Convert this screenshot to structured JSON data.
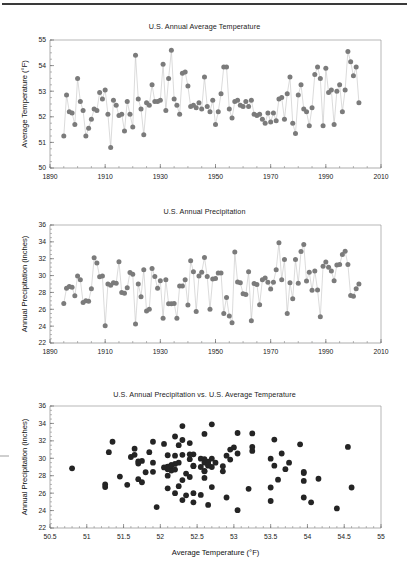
{
  "page": {
    "background": "#ffffff",
    "rule_color": "#3a3a3a",
    "marker_color_line_charts": "#7b7b7b",
    "marker_color_scatter": "#242424",
    "connector_color": "#bdbdbd"
  },
  "chart_data": [
    {
      "id": "temperature-timeseries",
      "type": "line",
      "title": "U.S. Annual Average Temperature",
      "xlabel": "",
      "ylabel": "Average Temperature (°F)",
      "xlim": [
        1890,
        2010
      ],
      "ylim": [
        50,
        55
      ],
      "xticks": [
        1890,
        1910,
        1930,
        1950,
        1970,
        1990,
        2010
      ],
      "yticks": [
        50,
        51,
        52,
        53,
        54,
        55
      ],
      "xtick_labels": [
        "1890",
        "1910",
        "1930",
        "1950",
        "1970",
        "1990",
        "2010"
      ],
      "ytick_labels": [
        "50",
        "51",
        "52",
        "53",
        "54",
        "55"
      ],
      "x_minor_step": 5,
      "y_minor_step": 0.25,
      "grid": false,
      "legend": "none",
      "markers": true,
      "x": [
        1895,
        1896,
        1897,
        1898,
        1899,
        1900,
        1901,
        1902,
        1903,
        1904,
        1905,
        1906,
        1907,
        1908,
        1909,
        1910,
        1911,
        1912,
        1913,
        1914,
        1915,
        1916,
        1917,
        1918,
        1919,
        1920,
        1921,
        1922,
        1923,
        1924,
        1925,
        1926,
        1927,
        1928,
        1929,
        1930,
        1931,
        1932,
        1933,
        1934,
        1935,
        1936,
        1937,
        1938,
        1939,
        1940,
        1941,
        1942,
        1943,
        1944,
        1945,
        1946,
        1947,
        1948,
        1949,
        1950,
        1951,
        1952,
        1953,
        1954,
        1955,
        1956,
        1957,
        1958,
        1959,
        1960,
        1961,
        1962,
        1963,
        1964,
        1965,
        1966,
        1967,
        1968,
        1969,
        1970,
        1971,
        1972,
        1973,
        1974,
        1975,
        1976,
        1977,
        1978,
        1979,
        1980,
        1981,
        1982,
        1983,
        1984,
        1985,
        1986,
        1987,
        1988,
        1989,
        1990,
        1991,
        1992,
        1993,
        1994,
        1995,
        1996,
        1997,
        1998,
        1999,
        2000,
        2001,
        2002
      ],
      "y": [
        51.25,
        52.85,
        52.2,
        52.15,
        51.7,
        53.5,
        52.6,
        52.25,
        51.25,
        51.55,
        51.9,
        52.3,
        52.25,
        52.95,
        52.7,
        53.05,
        52.1,
        50.8,
        52.65,
        52.45,
        52.05,
        52.1,
        51.45,
        52.6,
        52.1,
        51.6,
        54.4,
        52.7,
        52.3,
        51.3,
        52.55,
        52.45,
        53.25,
        52.6,
        52.6,
        52.65,
        54.05,
        52.25,
        53.5,
        54.6,
        52.7,
        52.45,
        52.1,
        53.7,
        53.75,
        53.2,
        52.4,
        52.45,
        52.35,
        52.55,
        52.3,
        53.55,
        52.4,
        52.2,
        52.65,
        51.7,
        52.2,
        52.9,
        53.95,
        53.95,
        52.3,
        51.95,
        52.6,
        52.65,
        52.45,
        52.4,
        52.6,
        52.4,
        52.65,
        52.1,
        52.05,
        52.1,
        51.9,
        51.75,
        52.15,
        51.8,
        52.15,
        51.85,
        52.7,
        52.75,
        51.9,
        52.9,
        53.55,
        51.75,
        51.35,
        52.85,
        53.25,
        52.3,
        52.2,
        51.65,
        52.35,
        53.65,
        53.95,
        53.5,
        51.65,
        53.9,
        52.95,
        53.05,
        51.7,
        53.0,
        53.25,
        52.2,
        53.05,
        54.55,
        54.15,
        53.6,
        53.95,
        52.55
      ]
    },
    {
      "id": "precipitation-timeseries",
      "type": "line",
      "title": "U.S. Annual Precipitation",
      "xlabel": "",
      "ylabel": "Annual Precipitation (inches)",
      "xlim": [
        1890,
        2010
      ],
      "ylim": [
        22,
        36
      ],
      "xticks": [
        1890,
        1910,
        1930,
        1950,
        1970,
        1990,
        2010
      ],
      "yticks": [
        22,
        24,
        26,
        28,
        30,
        32,
        34,
        36
      ],
      "xtick_labels": [
        "1890",
        "1910",
        "1930",
        "1950",
        "1970",
        "1990",
        "2010"
      ],
      "ytick_labels": [
        "22",
        "24",
        "26",
        "28",
        "30",
        "32",
        "34",
        "36"
      ],
      "x_minor_step": 5,
      "y_minor_step": 0.5,
      "grid": false,
      "legend": "none",
      "markers": true,
      "x": [
        1895,
        1896,
        1897,
        1898,
        1899,
        1900,
        1901,
        1902,
        1903,
        1904,
        1905,
        1906,
        1907,
        1908,
        1909,
        1910,
        1911,
        1912,
        1913,
        1914,
        1915,
        1916,
        1917,
        1918,
        1919,
        1920,
        1921,
        1922,
        1923,
        1924,
        1925,
        1926,
        1927,
        1928,
        1929,
        1930,
        1931,
        1932,
        1933,
        1934,
        1935,
        1936,
        1937,
        1938,
        1939,
        1940,
        1941,
        1942,
        1943,
        1944,
        1945,
        1946,
        1947,
        1948,
        1949,
        1950,
        1951,
        1952,
        1953,
        1954,
        1955,
        1956,
        1957,
        1958,
        1959,
        1960,
        1961,
        1962,
        1963,
        1964,
        1965,
        1966,
        1967,
        1968,
        1969,
        1970,
        1971,
        1972,
        1973,
        1974,
        1975,
        1976,
        1977,
        1978,
        1979,
        1980,
        1981,
        1982,
        1983,
        1984,
        1985,
        1986,
        1987,
        1988,
        1989,
        1990,
        1991,
        1992,
        1993,
        1994,
        1995,
        1996,
        1997,
        1998,
        1999,
        2000,
        2001,
        2002
      ],
      "y": [
        26.7,
        28.5,
        28.7,
        28.6,
        27.6,
        29.95,
        29.5,
        26.8,
        27.0,
        26.95,
        28.45,
        32.1,
        31.5,
        29.85,
        29.95,
        24.05,
        29.0,
        28.85,
        29.15,
        29.1,
        31.65,
        28.0,
        27.9,
        28.55,
        30.35,
        30.15,
        24.25,
        29.0,
        27.5,
        30.7,
        25.8,
        26.0,
        30.85,
        29.9,
        28.5,
        29.4,
        24.95,
        29.5,
        26.65,
        26.65,
        26.7,
        24.95,
        28.75,
        28.75,
        29.5,
        26.5,
        31.75,
        30.45,
        25.75,
        29.95,
        30.4,
        32.15,
        29.9,
        26.0,
        29.6,
        29.65,
        30.3,
        30.3,
        25.5,
        27.4,
        25.2,
        24.4,
        32.8,
        29.25,
        29.15,
        27.85,
        27.75,
        30.45,
        24.65,
        29.05,
        28.95,
        26.55,
        29.5,
        29.7,
        29.2,
        28.4,
        29.2,
        30.7,
        33.9,
        29.5,
        31.9,
        25.5,
        29.15,
        27.25,
        31.9,
        29.1,
        32.85,
        33.7,
        29.35,
        30.4,
        28.25,
        30.55,
        28.3,
        25.1,
        31.1,
        31.6,
        31.0,
        30.55,
        29.4,
        31.25,
        31.3,
        32.5,
        32.9,
        31.3,
        27.65,
        27.55,
        28.45,
        29.0
      ]
    },
    {
      "id": "precip-vs-temp-scatter",
      "type": "scatter",
      "title": "U.S. Annual Precipitation vs. U.S. Average Temperature",
      "xlabel": "Average Temperature (°F)",
      "ylabel": "Annual Precipitation (inches)",
      "xlim": [
        50.5,
        55
      ],
      "ylim": [
        22,
        36
      ],
      "xticks": [
        50.5,
        51,
        51.5,
        52,
        52.5,
        53,
        53.5,
        54,
        54.5,
        55
      ],
      "yticks": [
        22,
        24,
        26,
        28,
        30,
        32,
        34,
        36
      ],
      "xtick_labels": [
        "50.5",
        "51",
        "51.5",
        "52",
        "52.5",
        "53",
        "53.5",
        "54",
        "54.5",
        "55"
      ],
      "ytick_labels": [
        "22",
        "24",
        "26",
        "28",
        "30",
        "32",
        "34",
        "36"
      ],
      "x_minor_step": 0.1,
      "y_minor_step": 0.5,
      "grid": false,
      "legend": "none",
      "markers": true,
      "x": [
        51.25,
        52.85,
        52.2,
        52.15,
        51.7,
        53.5,
        52.6,
        52.25,
        51.25,
        51.55,
        51.9,
        52.3,
        52.25,
        52.95,
        52.7,
        53.05,
        52.1,
        50.8,
        52.65,
        52.45,
        52.05,
        52.1,
        51.45,
        52.6,
        52.1,
        51.6,
        54.4,
        52.7,
        52.3,
        51.3,
        52.55,
        52.45,
        53.25,
        52.6,
        52.6,
        52.65,
        54.05,
        52.25,
        53.5,
        54.6,
        52.7,
        52.45,
        52.1,
        53.7,
        53.75,
        53.2,
        52.4,
        52.45,
        52.35,
        52.55,
        52.3,
        53.55,
        52.4,
        52.2,
        52.65,
        51.7,
        52.2,
        52.9,
        53.95,
        53.95,
        52.3,
        51.95,
        52.6,
        52.65,
        52.45,
        52.4,
        52.6,
        52.4,
        52.65,
        52.1,
        52.05,
        52.1,
        51.9,
        51.75,
        52.15,
        51.8,
        52.15,
        51.85,
        52.7,
        52.75,
        51.9,
        52.9,
        53.55,
        51.75,
        51.35,
        52.85,
        53.25,
        52.3,
        52.2,
        51.65,
        52.35,
        53.65,
        53.95,
        53.5,
        51.65,
        53.9,
        52.95,
        53.05,
        51.7,
        53.0,
        53.25,
        52.2,
        53.05,
        54.55,
        54.15,
        53.6,
        53.95,
        52.55
      ],
      "y": [
        26.7,
        28.5,
        28.7,
        28.6,
        27.6,
        29.95,
        29.5,
        26.8,
        27.0,
        26.95,
        28.45,
        32.1,
        31.5,
        29.85,
        29.95,
        24.05,
        29.0,
        28.85,
        29.15,
        29.1,
        31.65,
        28.0,
        27.9,
        28.55,
        30.35,
        30.15,
        24.25,
        29.0,
        27.5,
        30.7,
        25.8,
        26.0,
        30.85,
        29.9,
        28.5,
        29.4,
        24.95,
        29.5,
        26.65,
        26.65,
        26.7,
        24.95,
        28.75,
        28.75,
        29.5,
        26.5,
        31.75,
        30.45,
        25.75,
        29.95,
        30.4,
        32.15,
        29.9,
        26.0,
        29.6,
        29.65,
        30.3,
        30.3,
        25.5,
        27.4,
        25.2,
        24.4,
        32.8,
        29.25,
        29.15,
        27.85,
        27.75,
        30.45,
        24.65,
        29.05,
        28.95,
        26.55,
        29.5,
        29.7,
        29.2,
        28.4,
        29.2,
        30.7,
        33.9,
        29.5,
        31.9,
        25.5,
        29.15,
        27.25,
        31.9,
        29.1,
        32.85,
        33.7,
        29.35,
        30.4,
        28.25,
        30.55,
        28.3,
        25.1,
        31.1,
        31.6,
        31.0,
        30.55,
        29.4,
        31.25,
        31.3,
        32.5,
        32.9,
        31.3,
        27.65,
        27.55,
        28.45,
        29.0
      ]
    }
  ]
}
